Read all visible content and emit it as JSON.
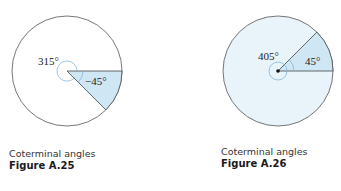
{
  "figures": [
    {
      "id": "A.25",
      "caption": "Coterminal angles",
      "figure_label": "Figure A.25",
      "angle_large_label": "315°",
      "angle_small_label": "−45°",
      "fill_color": "#cfe6f5",
      "arc_color": "#7fb8dc"
    },
    {
      "id": "A.26",
      "caption": "Coterminal angles",
      "figure_label": "Figure A.26",
      "angle_large_label": "405°",
      "angle_small_label": "45°",
      "fill_color": "#cfe6f5",
      "background_fill": "#e8f3fa",
      "arc_color": "#7fb8dc"
    }
  ]
}
